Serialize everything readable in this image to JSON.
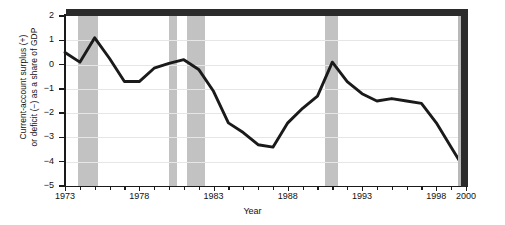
{
  "chart_data": {
    "type": "line",
    "title": "",
    "xlabel": "Year",
    "ylabel": "Current-account surplus (+)\nor deficit (−) as a share of GDP",
    "xlim": [
      1973,
      2000
    ],
    "ylim": [
      -5,
      2
    ],
    "grid": true,
    "legend": "none",
    "y_ticks": [
      2,
      1,
      0,
      -1,
      -2,
      -3,
      -4,
      -5
    ],
    "y_tick_labels": [
      "2",
      "1",
      "0",
      "−1",
      "−2",
      "−3",
      "−4",
      "−5"
    ],
    "x_ticks": [
      1973,
      1974,
      1975,
      1976,
      1977,
      1978,
      1979,
      1980,
      1981,
      1982,
      1983,
      1984,
      1985,
      1986,
      1987,
      1988,
      1989,
      1990,
      1991,
      1992,
      1993,
      1994,
      1995,
      1996,
      1997,
      1998,
      1999,
      2000
    ],
    "x_tick_labels": [
      {
        "value": 1973,
        "label": "1973"
      },
      {
        "value": 1978,
        "label": "1978"
      },
      {
        "value": 1983,
        "label": "1983"
      },
      {
        "value": 1988,
        "label": "1988"
      },
      {
        "value": 1993,
        "label": "1993"
      },
      {
        "value": 1998,
        "label": "1998"
      },
      {
        "value": 2000,
        "label": "2000"
      }
    ],
    "series": [
      {
        "name": "Current-account balance as a share of GDP",
        "color": "#1a1a1a",
        "x": [
          1973,
          1974,
          1975,
          1976,
          1977,
          1978,
          1979,
          1980,
          1981,
          1982,
          1983,
          1984,
          1985,
          1986,
          1987,
          1988,
          1989,
          1990,
          1991,
          1992,
          1993,
          1994,
          1995,
          1996,
          1997,
          1998,
          1999,
          2000
        ],
        "values": [
          0.5,
          0.1,
          1.1,
          0.25,
          -0.7,
          -0.7,
          -0.15,
          0.05,
          0.2,
          -0.2,
          -1.1,
          -2.4,
          -2.8,
          -3.3,
          -3.4,
          -2.4,
          -1.8,
          -1.3,
          0.1,
          -0.7,
          -1.2,
          -1.5,
          -1.4,
          -1.5,
          -1.6,
          -2.4,
          -3.4,
          -4.4
        ]
      }
    ],
    "shaded_regions": {
      "label": "recession-bands",
      "color": "#c2c2c2",
      "spans": [
        {
          "start": 1973.85,
          "end": 1975.2
        },
        {
          "start": 1980.0,
          "end": 1980.55
        },
        {
          "start": 1981.2,
          "end": 1982.4
        },
        {
          "start": 1990.5,
          "end": 1991.35
        }
      ]
    }
  }
}
